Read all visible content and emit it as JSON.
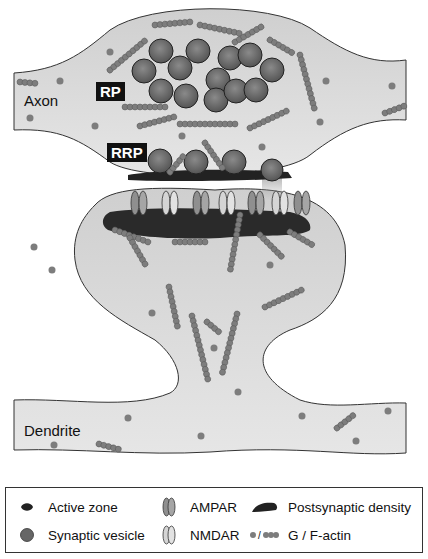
{
  "diagram": {
    "labels": {
      "axon": "Axon",
      "dendrite": "Dendrite",
      "rp": "RP",
      "rrp": "RRP"
    },
    "colors": {
      "cytoplasm": "#dcdcdc",
      "vesicle": "#6e6e6e",
      "actin": "#8a8a8a",
      "density": "#2a2a2a",
      "outline": "#333333",
      "tag_bg": "#111111"
    }
  },
  "legend": {
    "items": [
      {
        "icon": "active-zone-icon",
        "label": "Active zone"
      },
      {
        "icon": "ampar-icon",
        "label": "AMPAR"
      },
      {
        "icon": "postsynaptic-density-icon",
        "label": "Postsynaptic density"
      },
      {
        "icon": "synaptic-vesicle-icon",
        "label": "Synaptic vesicle"
      },
      {
        "icon": "nmdar-icon",
        "label": "NMDAR"
      },
      {
        "icon": "actin-icon",
        "label": "G / F-actin",
        "glyph_sep": "/"
      }
    ]
  }
}
